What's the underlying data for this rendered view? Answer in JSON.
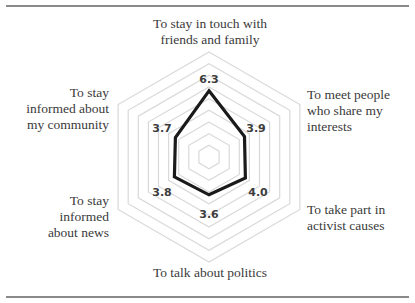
{
  "chart_data": {
    "type": "radar",
    "title": "",
    "axes": [
      "To stay in touch with friends and family",
      "To meet people who share my interests",
      "To take part in activist causes",
      "To talk about politics",
      "To stay informed about news",
      "To stay informed about my community"
    ],
    "series": [
      {
        "name": "",
        "values": [
          6.3,
          3.9,
          4.0,
          3.6,
          3.8,
          3.7
        ]
      }
    ],
    "data_labels": [
      "6.3",
      "3.9",
      "4.0",
      "3.6",
      "3.8",
      "3.7"
    ],
    "range": [
      0,
      10
    ],
    "grid": "hexagonal rings",
    "legend": "none"
  },
  "labels": {
    "top_line1": "To stay in touch with",
    "top_line2": "friends and family",
    "ur_line1": "To meet people",
    "ur_line2": "who share my",
    "ur_line3": "interests",
    "lr_line1": "To take part in",
    "lr_line2": "activist causes",
    "bottom": "To talk about politics",
    "ll_line1": "To stay",
    "ll_line2": "informed",
    "ll_line3": "about news",
    "ul_line1": "To stay",
    "ul_line2": "informed about",
    "ul_line3": "my community"
  },
  "values": {
    "top": "6.3",
    "ur": "3.9",
    "lr": "4.0",
    "bottom": "3.6",
    "ll": "3.8",
    "ul": "3.7"
  },
  "colors": {
    "grid": "#d9d9d9",
    "series": "#1a1a1a",
    "rule": "#8a8a8a"
  }
}
